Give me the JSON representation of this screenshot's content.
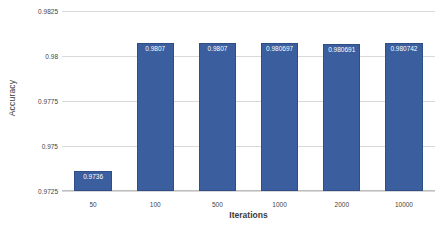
{
  "chart_data": {
    "type": "bar",
    "title": "",
    "xlabel": "Iterations",
    "ylabel": "Accuracy",
    "categories": [
      "50",
      "100",
      "500",
      "1000",
      "2000",
      "10000"
    ],
    "values": [
      0.9736,
      0.9807,
      0.9807,
      0.980697,
      0.980691,
      0.980742
    ],
    "data_labels": [
      "0.9736",
      "0.9807",
      "0.9807",
      "0.980697",
      "0.980691",
      "0.980742"
    ],
    "ylim": [
      0.9725,
      0.9825
    ],
    "ytick_labels": [
      "0.9825",
      "0.98",
      "0.9775",
      "0.975",
      "0.9725"
    ],
    "ytick_values": [
      0.9825,
      0.98,
      0.9775,
      0.975,
      0.9725
    ],
    "grid": true,
    "legend": false,
    "series_color": "#3a5e9e",
    "gridline_color": "#d9d9d9",
    "data_label_color": "#ffffff",
    "background_color": "#ffffff"
  }
}
